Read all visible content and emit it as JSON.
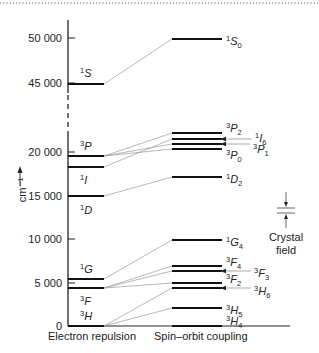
{
  "diagram": {
    "y_axis": {
      "label": "cm⁻¹",
      "ticks": [
        {
          "value": "50 000",
          "y": 38
        },
        {
          "value": "45 000",
          "y": 83
        },
        {
          "value": "20 000",
          "y": 152
        },
        {
          "value": "15 000",
          "y": 196
        },
        {
          "value": "10 000",
          "y": 239
        },
        {
          "value": "5 000",
          "y": 283
        },
        {
          "value": "0",
          "y": 326
        }
      ]
    },
    "x_labels": {
      "left": "Electron repulsion",
      "right": "Spin–orbit coupling"
    },
    "electron_repulsion_terms": [
      {
        "term": "1S",
        "mult": "1",
        "L": "S",
        "y": 84,
        "label_y": 77,
        "label_pos": "above"
      },
      {
        "term": "3P",
        "mult": "3",
        "L": "P",
        "y": 156,
        "label_y": 150,
        "label_pos": "above"
      },
      {
        "term": "1I",
        "mult": "1",
        "L": "I",
        "y": 167,
        "label_y": 180,
        "label_pos": "below"
      },
      {
        "term": "1D",
        "mult": "1",
        "L": "D",
        "y": 196,
        "label_y": 210,
        "label_pos": "below"
      },
      {
        "term": "1G",
        "mult": "1",
        "L": "G",
        "y": 279,
        "label_y": 273,
        "label_pos": "above"
      },
      {
        "term": "3F",
        "mult": "3",
        "L": "F",
        "y": 288,
        "label_y": 301,
        "label_pos": "below"
      },
      {
        "term": "3H",
        "mult": "3",
        "L": "H",
        "y": 326,
        "label_y": 320,
        "label_pos": "above"
      }
    ],
    "spin_orbit_levels": [
      {
        "term": "1S0",
        "mult": "1",
        "L": "S",
        "J": "0",
        "y": 39,
        "from": "1S"
      },
      {
        "term": "3P2",
        "mult": "3",
        "L": "P",
        "J": "2",
        "y": 133,
        "from": "3P"
      },
      {
        "term": "1I6",
        "mult": "1",
        "L": "I",
        "J": "6",
        "y": 139,
        "from": "1I"
      },
      {
        "term": "3P1",
        "mult": "3",
        "L": "P",
        "J": "1",
        "y": 144,
        "from": "3P"
      },
      {
        "term": "3P0",
        "mult": "3",
        "L": "P",
        "J": "0",
        "y": 149,
        "from": "3P"
      },
      {
        "term": "1D2",
        "mult": "1",
        "L": "D",
        "J": "2",
        "y": 177,
        "from": "1D"
      },
      {
        "term": "1G4",
        "mult": "1",
        "L": "G",
        "J": "4",
        "y": 240,
        "from": "1G"
      },
      {
        "term": "3F4",
        "mult": "3",
        "L": "F",
        "J": "4",
        "y": 266,
        "from": "3F"
      },
      {
        "term": "3F3",
        "mult": "3",
        "L": "F",
        "J": "3",
        "y": 271,
        "from": "3F"
      },
      {
        "term": "3F2",
        "mult": "3",
        "L": "F",
        "J": "2",
        "y": 283,
        "from": "3F"
      },
      {
        "term": "3H6",
        "mult": "3",
        "L": "H",
        "J": "6",
        "y": 288,
        "from": "3H"
      },
      {
        "term": "3H5",
        "mult": "3",
        "L": "H",
        "J": "5",
        "y": 308,
        "from": "3H"
      },
      {
        "term": "3H4",
        "mult": "3",
        "L": "H",
        "J": "4",
        "y": 326,
        "from": "3H"
      }
    ],
    "crystal_field": {
      "label_line1": "Crystal",
      "label_line2": "field"
    }
  }
}
